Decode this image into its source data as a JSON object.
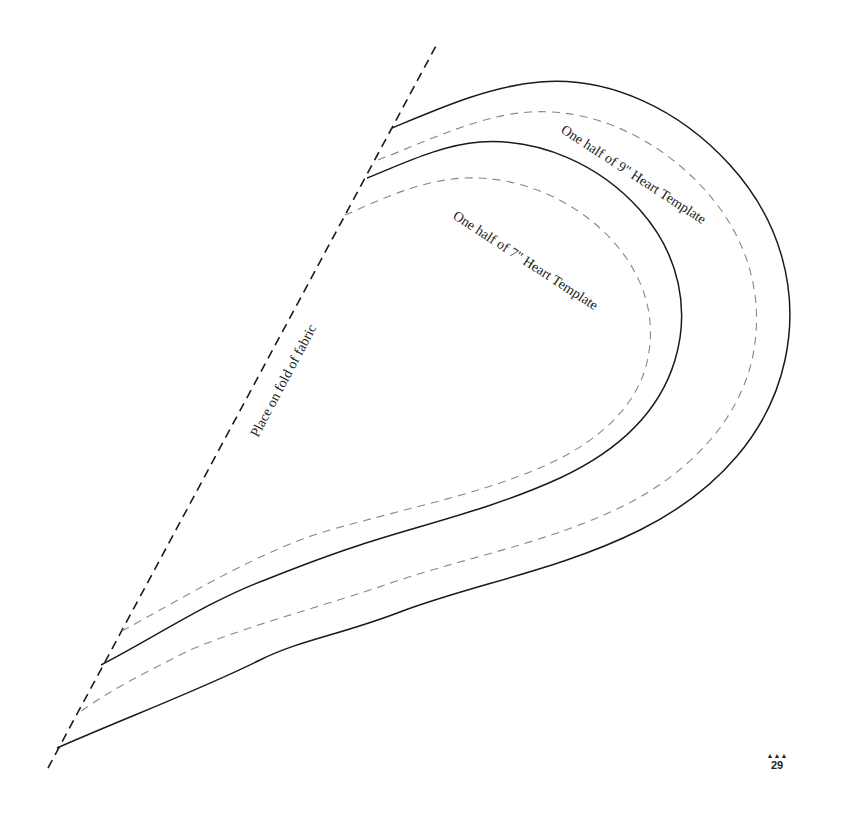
{
  "page": {
    "background": "#ffffff",
    "ink_color": "#1a1a1a",
    "seam_color": "#888888"
  },
  "labels": {
    "fold": "Place on fold of fabric",
    "template_9": "One half of 9\" Heart Template",
    "template_7": "One half of 7\" Heart Template"
  },
  "footer": {
    "ornament": "▲▲▲",
    "page_number": "29"
  },
  "shapes": [
    {
      "name": "fold-line",
      "style": "dashed",
      "from": [
        48,
        768
      ],
      "to": [
        437,
        44
      ]
    },
    {
      "name": "heart-9-cut-line",
      "style": "solid"
    },
    {
      "name": "heart-9-seam-line",
      "style": "dashed-gray"
    },
    {
      "name": "heart-7-cut-line",
      "style": "solid"
    },
    {
      "name": "heart-7-seam-line",
      "style": "dashed-gray"
    }
  ]
}
